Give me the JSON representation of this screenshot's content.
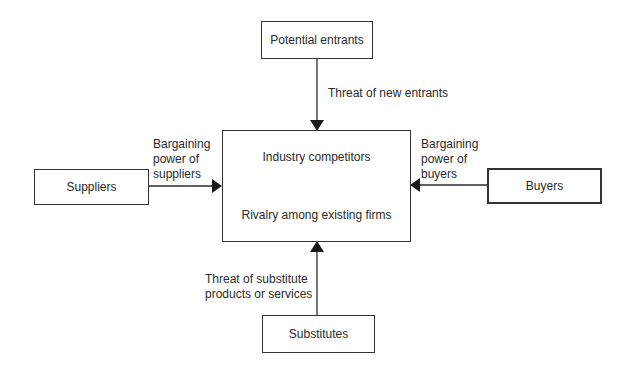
{
  "diagram": {
    "nodes": {
      "potential_entrants": "Potential entrants",
      "suppliers": "Suppliers",
      "buyers": "Buyers",
      "substitutes": "Substitutes",
      "industry": {
        "title": "Industry competitors",
        "subtitle": "Rivalry among existing firms"
      }
    },
    "edges": {
      "entrants": {
        "from": "Potential entrants",
        "to": "Industry competitors",
        "label": "Threat of new entrants"
      },
      "suppliers": {
        "from": "Suppliers",
        "to": "Industry competitors",
        "label_lines": [
          "Bargaining",
          "power of",
          "suppliers"
        ]
      },
      "buyers": {
        "from": "Buyers",
        "to": "Industry competitors",
        "label_lines": [
          "Bargaining",
          "power of",
          "buyers"
        ]
      },
      "substitutes": {
        "from": "Substitutes",
        "to": "Industry competitors",
        "label_lines": [
          "Threat of substitute",
          "products or services"
        ]
      }
    },
    "colors": {
      "line": "#2a2a2a",
      "text": "#2a2a2a",
      "background": "#ffffff"
    }
  }
}
